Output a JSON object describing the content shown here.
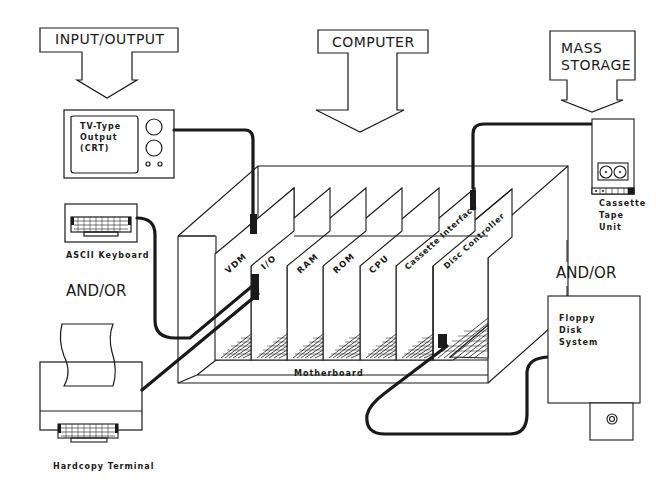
{
  "diagram": {
    "title_blocks": {
      "input_output": "INPUT/OUTPUT",
      "computer": "COMPUTER",
      "mass_storage_line1": "MASS",
      "mass_storage_line2": "STORAGE"
    },
    "devices": {
      "crt": {
        "line1": "TV-Type",
        "line2": "Output",
        "line3": "(CRT)"
      },
      "keyboard": "ASCII Keyboard",
      "hardcopy": "Hardcopy Terminal",
      "cassette": {
        "line1": "Cassette",
        "line2": "Tape",
        "line3": "Unit"
      },
      "floppy": {
        "line1": "Floppy",
        "line2": "Disk",
        "line3": "System"
      }
    },
    "connectors": {
      "andor_left": "AND/OR",
      "andor_right": "AND/OR"
    },
    "cards": [
      "VDM",
      "I/O",
      "RAM",
      "ROM",
      "CPU",
      "Cassette Interface",
      "Disc Controller"
    ],
    "motherboard": "Motherboard",
    "colors": {
      "line": "#1a1a1a",
      "background": "#ffffff"
    }
  }
}
